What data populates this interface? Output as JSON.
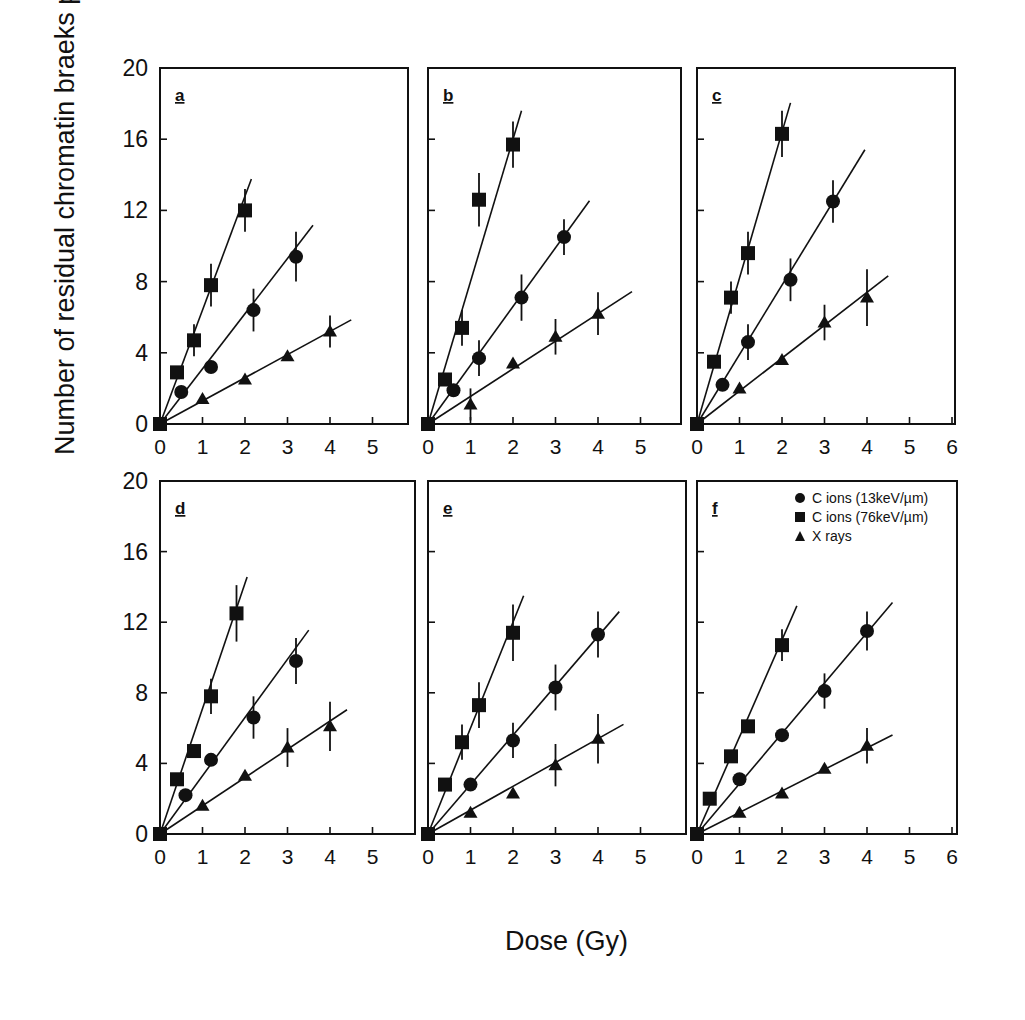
{
  "figure": {
    "ylabel": "Number of residual chromatin braeks per cell",
    "xlabel": "Dose (Gy)"
  },
  "legend": [
    {
      "marker": "circle",
      "label": "C ions (13keV/µm)"
    },
    {
      "marker": "square",
      "label": "C ions (76keV/µm)"
    },
    {
      "marker": "triangle",
      "label": "X rays"
    }
  ],
  "chart_data": [
    {
      "panel": "a",
      "type": "scatter",
      "xlim": [
        0,
        6
      ],
      "ylim": [
        0,
        20
      ],
      "xticks": [
        0,
        1,
        2,
        3,
        4,
        5
      ],
      "yticks": [
        0,
        4,
        8,
        12,
        16,
        20
      ],
      "series": [
        {
          "name": "C ions (13keV/µm)",
          "marker": "circle",
          "x": [
            0,
            0.5,
            1.2,
            2.2,
            3.2
          ],
          "y": [
            0,
            1.8,
            3.2,
            6.4,
            9.4
          ],
          "err": [
            0,
            0,
            0,
            1.2,
            1.4
          ],
          "fit_slope": 3.1,
          "fit_xmax": 3.6
        },
        {
          "name": "C ions (76keV/µm)",
          "marker": "square",
          "x": [
            0,
            0.4,
            0.8,
            1.2,
            2.0
          ],
          "y": [
            0,
            2.9,
            4.7,
            7.8,
            12.0
          ],
          "err": [
            0,
            0,
            0.9,
            1.2,
            1.2
          ],
          "fit_slope": 6.4,
          "fit_xmax": 2.15
        },
        {
          "name": "X rays",
          "marker": "triangle",
          "x": [
            0,
            1,
            2,
            3,
            4
          ],
          "y": [
            0,
            1.4,
            2.5,
            3.8,
            5.2
          ],
          "err": [
            0,
            0,
            0,
            0,
            0.9
          ],
          "fit_slope": 1.3,
          "fit_xmax": 4.5
        }
      ]
    },
    {
      "panel": "b",
      "type": "scatter",
      "xlim": [
        0,
        6
      ],
      "ylim": [
        0,
        20
      ],
      "xticks": [
        0,
        1,
        2,
        3,
        4,
        5
      ],
      "yticks": [
        0,
        4,
        8,
        12,
        16,
        20
      ],
      "series": [
        {
          "name": "C ions (13keV/µm)",
          "marker": "circle",
          "x": [
            0,
            0.6,
            1.2,
            2.2,
            3.2
          ],
          "y": [
            0,
            1.9,
            3.7,
            7.1,
            10.5
          ],
          "err": [
            0,
            0,
            1.0,
            1.3,
            1.0
          ],
          "fit_slope": 3.3,
          "fit_xmax": 3.8
        },
        {
          "name": "C ions (76keV/µm)",
          "marker": "square",
          "x": [
            0,
            0.4,
            0.8,
            1.2,
            2.0
          ],
          "y": [
            0,
            2.5,
            5.4,
            12.6,
            15.7
          ],
          "err": [
            0,
            0,
            1.0,
            1.5,
            1.3
          ],
          "fit_slope": 8.0,
          "fit_xmax": 2.2
        },
        {
          "name": "X rays",
          "marker": "triangle",
          "x": [
            0,
            1,
            2,
            3,
            4
          ],
          "y": [
            0,
            1.1,
            3.4,
            4.9,
            6.2
          ],
          "err": [
            0,
            0.9,
            0,
            1.0,
            1.2
          ],
          "fit_slope": 1.55,
          "fit_xmax": 4.8
        }
      ]
    },
    {
      "panel": "c",
      "type": "scatter",
      "xlim": [
        0,
        6
      ],
      "ylim": [
        0,
        20
      ],
      "xticks": [
        0,
        1,
        2,
        3,
        4,
        5,
        6
      ],
      "yticks": [
        0,
        4,
        8,
        12,
        16,
        20
      ],
      "series": [
        {
          "name": "C ions (13keV/µm)",
          "marker": "circle",
          "x": [
            0,
            0.6,
            1.2,
            2.2,
            3.2
          ],
          "y": [
            0,
            2.2,
            4.6,
            8.1,
            12.5
          ],
          "err": [
            0,
            0,
            1.0,
            1.2,
            1.2
          ],
          "fit_slope": 3.9,
          "fit_xmax": 3.95
        },
        {
          "name": "C ions (76keV/µm)",
          "marker": "square",
          "x": [
            0,
            0.4,
            0.8,
            1.2,
            2.0
          ],
          "y": [
            0,
            3.5,
            7.1,
            9.6,
            16.3
          ],
          "err": [
            0,
            0,
            0.9,
            1.2,
            1.3
          ],
          "fit_slope": 8.2,
          "fit_xmax": 2.2
        },
        {
          "name": "X rays",
          "marker": "triangle",
          "x": [
            0,
            1,
            2,
            3,
            4
          ],
          "y": [
            0,
            2.0,
            3.6,
            5.7,
            7.1
          ],
          "err": [
            0,
            0,
            0,
            1.0,
            1.6
          ],
          "fit_slope": 1.85,
          "fit_xmax": 4.5
        }
      ]
    },
    {
      "panel": "d",
      "type": "scatter",
      "xlim": [
        0,
        6
      ],
      "ylim": [
        0,
        20
      ],
      "xticks": [
        0,
        1,
        2,
        3,
        4,
        5
      ],
      "yticks": [
        0,
        4,
        8,
        12,
        16,
        20
      ],
      "series": [
        {
          "name": "C ions (13keV/µm)",
          "marker": "circle",
          "x": [
            0,
            0.6,
            1.2,
            2.2,
            3.2
          ],
          "y": [
            0,
            2.2,
            4.2,
            6.6,
            9.8
          ],
          "err": [
            0,
            0,
            0,
            1.2,
            1.3
          ],
          "fit_slope": 3.3,
          "fit_xmax": 3.5
        },
        {
          "name": "C ions (76keV/µm)",
          "marker": "square",
          "x": [
            0,
            0.4,
            0.8,
            1.2,
            1.8
          ],
          "y": [
            0,
            3.1,
            4.7,
            7.8,
            12.5
          ],
          "err": [
            0,
            0,
            0,
            1.0,
            1.6
          ],
          "fit_slope": 7.1,
          "fit_xmax": 2.05
        },
        {
          "name": "X rays",
          "marker": "triangle",
          "x": [
            0,
            1,
            2,
            3,
            4
          ],
          "y": [
            0,
            1.6,
            3.3,
            4.9,
            6.1
          ],
          "err": [
            0,
            0,
            0,
            1.1,
            1.4
          ],
          "fit_slope": 1.6,
          "fit_xmax": 4.4
        }
      ]
    },
    {
      "panel": "e",
      "type": "scatter",
      "xlim": [
        0,
        6
      ],
      "ylim": [
        0,
        20
      ],
      "xticks": [
        0,
        1,
        2,
        3,
        4,
        5
      ],
      "yticks": [
        0,
        4,
        8,
        12,
        16,
        20
      ],
      "series": [
        {
          "name": "C ions (13keV/µm)",
          "marker": "circle",
          "x": [
            0,
            1,
            2,
            3,
            4
          ],
          "y": [
            0,
            2.8,
            5.3,
            8.3,
            11.3
          ],
          "err": [
            0,
            0,
            1.0,
            1.3,
            1.3
          ],
          "fit_slope": 2.8,
          "fit_xmax": 4.5
        },
        {
          "name": "C ions (76keV/µm)",
          "marker": "square",
          "x": [
            0,
            0.4,
            0.8,
            1.2,
            2.0
          ],
          "y": [
            0,
            2.8,
            5.2,
            7.3,
            11.4
          ],
          "err": [
            0,
            0,
            1.0,
            1.3,
            1.6
          ],
          "fit_slope": 6.0,
          "fit_xmax": 2.25
        },
        {
          "name": "X rays",
          "marker": "triangle",
          "x": [
            0,
            1,
            2,
            3,
            4
          ],
          "y": [
            0,
            1.2,
            2.3,
            3.9,
            5.4
          ],
          "err": [
            0,
            0,
            0,
            1.2,
            1.4
          ],
          "fit_slope": 1.35,
          "fit_xmax": 4.6
        }
      ]
    },
    {
      "panel": "f",
      "type": "scatter",
      "xlim": [
        0,
        6
      ],
      "ylim": [
        0,
        20
      ],
      "xticks": [
        0,
        1,
        2,
        3,
        4,
        5,
        6
      ],
      "yticks": [
        0,
        4,
        8,
        12,
        16,
        20
      ],
      "series": [
        {
          "name": "C ions (13keV/µm)",
          "marker": "circle",
          "x": [
            0,
            1,
            2,
            3,
            4
          ],
          "y": [
            0,
            3.1,
            5.6,
            8.1,
            11.5
          ],
          "err": [
            0,
            0,
            0,
            1.0,
            1.1
          ],
          "fit_slope": 2.85,
          "fit_xmax": 4.6
        },
        {
          "name": "C ions (76keV/µm)",
          "marker": "square",
          "x": [
            0,
            0.3,
            0.8,
            1.2,
            2.0
          ],
          "y": [
            0,
            2.0,
            4.4,
            6.1,
            10.7
          ],
          "err": [
            0,
            0,
            0,
            0,
            0.9
          ],
          "fit_slope": 5.5,
          "fit_xmax": 2.35
        },
        {
          "name": "X rays",
          "marker": "triangle",
          "x": [
            0,
            1,
            2,
            3,
            4
          ],
          "y": [
            0,
            1.2,
            2.3,
            3.7,
            5.0
          ],
          "err": [
            0,
            0,
            0,
            0,
            1.0
          ],
          "fit_slope": 1.22,
          "fit_xmax": 4.6
        }
      ]
    }
  ]
}
